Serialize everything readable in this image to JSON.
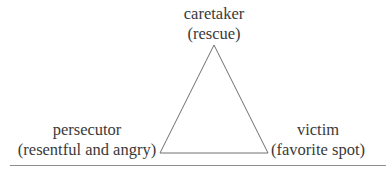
{
  "diagram": {
    "type": "triangle",
    "nodes": [
      {
        "id": "top",
        "role": "caretaker",
        "label": "caretaker",
        "sublabel": "(rescue)"
      },
      {
        "id": "left",
        "role": "persecutor",
        "label": "persecutor",
        "sublabel": "(resentful and angry)"
      },
      {
        "id": "right",
        "role": "victim",
        "label": "victim",
        "sublabel": "(favorite spot)"
      }
    ],
    "edges": [
      {
        "from": "top",
        "to": "left"
      },
      {
        "from": "left",
        "to": "right"
      },
      {
        "from": "right",
        "to": "top"
      }
    ],
    "colors": {
      "text": "#3a3a3a",
      "line": "#707070",
      "rule": "#8e8e8e",
      "background": "#ffffff"
    }
  }
}
